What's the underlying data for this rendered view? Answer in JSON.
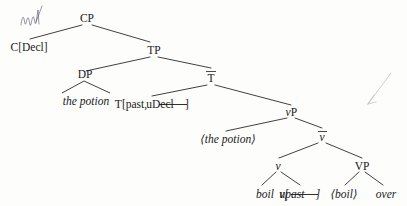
{
  "diagram": {
    "kind": "syntax-tree",
    "nodes": {
      "cp": "CP",
      "c_decl": "C[Decl]",
      "tp": "TP",
      "dp": "DP",
      "dp_phrase": "the potion",
      "tbar": "T",
      "tbar_overbar": true,
      "t_head": "T[past, uDecl]",
      "t_head_plain": "T[past, ",
      "t_head_struck": "uDecl",
      "t_head_close": "]",
      "vp_small": "vP",
      "trace_potion": "⟨the potion⟩",
      "vbar": "v",
      "vbar_overbar": true,
      "v_head": "v",
      "vp_big": "VP",
      "boil": "boil",
      "v_feature_open": "v[",
      "v_feature_struck": "upast",
      "v_feature_close": "]",
      "trace_boil": "⟨boil⟩",
      "over": "over"
    },
    "annotations": {
      "handwritten_scribble": "pen-scribble-top-left",
      "grey_arrow": "pen-arrow-right"
    },
    "colors": {
      "ink": "#1a1a1a",
      "line": "#2b2b2b",
      "page": "#fdfdfc",
      "pen_blue": "#55576a",
      "pen_grey": "#b9bcc4"
    }
  }
}
